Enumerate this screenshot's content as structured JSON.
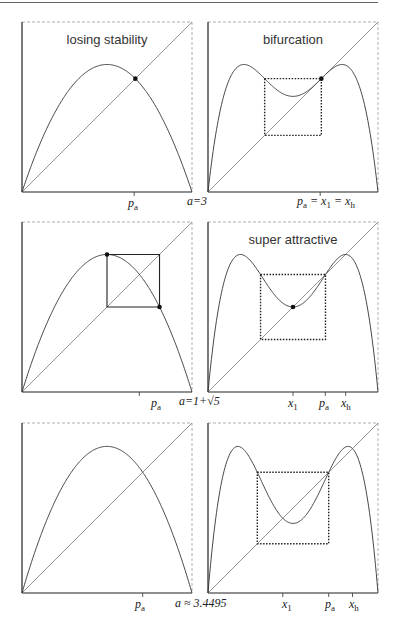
{
  "figure": {
    "panels": [
      {
        "id": "tl",
        "title": "losing stability",
        "a_label": "a=3",
        "ticks": [
          {
            "name": "p",
            "sub": "a",
            "x": 0.66
          }
        ],
        "map": "f",
        "a": 3.0
      },
      {
        "id": "tr",
        "title": "bifurcation",
        "ticks": [
          {
            "name": "p",
            "sub": "a",
            "extra": " = x₁ = xₕ",
            "x": 0.66
          }
        ],
        "map": "f2",
        "a": 3.0
      },
      {
        "id": "ml",
        "title": "",
        "a_label": "a=1+√5",
        "ticks": [
          {
            "name": "p",
            "sub": "a",
            "x": 0.69
          }
        ],
        "map": "f",
        "a": 3.236
      },
      {
        "id": "mr",
        "title": "super attractive",
        "ticks": [
          {
            "name": "x",
            "sub": "1",
            "x": 0.5
          },
          {
            "name": "p",
            "sub": "a",
            "x": 0.69
          },
          {
            "name": "x",
            "sub": "h",
            "x": 0.81
          }
        ],
        "map": "f2",
        "a": 3.236
      },
      {
        "id": "bl",
        "title": "",
        "a_label": "a ≈ 3.4495",
        "ticks": [
          {
            "name": "p",
            "sub": "a",
            "x": 0.71
          }
        ],
        "map": "f",
        "a": 3.4495
      },
      {
        "id": "br",
        "title": "",
        "ticks": [
          {
            "name": "x",
            "sub": "1",
            "x": 0.44
          },
          {
            "name": "p",
            "sub": "a",
            "x": 0.71
          },
          {
            "name": "x",
            "sub": "h",
            "x": 0.85
          }
        ],
        "map": "f2",
        "a": 3.4495
      }
    ],
    "labels": {
      "tl_title": "losing stability",
      "tr_title": "bifurcation",
      "mr_title": "super attractive",
      "a1": "a=3",
      "a2": "a=1+√5",
      "a3": "a ≈ 3.4495"
    }
  }
}
